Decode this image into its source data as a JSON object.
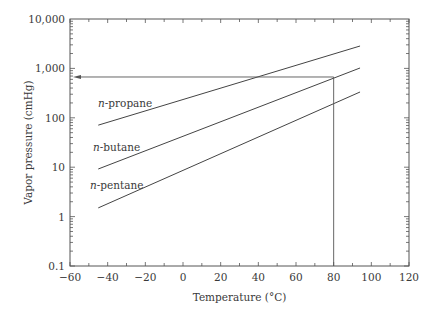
{
  "chart_data": {
    "type": "line",
    "title": "",
    "xlabel": "Temperature (°C)",
    "ylabel": "Vapor pressure (cmHg)",
    "xlim": [
      -60,
      120
    ],
    "ylim": [
      0.1,
      10000
    ],
    "yscale": "log",
    "grid": false,
    "legend": "inline labels",
    "x_ticks": [
      -60,
      -40,
      -20,
      0,
      20,
      40,
      60,
      80,
      100,
      120
    ],
    "x_tick_labels": [
      "−60",
      "−40",
      "−20",
      "0",
      "20",
      "40",
      "60",
      "80",
      "100",
      "120"
    ],
    "y_ticks": [
      0.1,
      1,
      10,
      100,
      1000,
      10000
    ],
    "y_tick_labels": [
      "0.1",
      "1",
      "10",
      "100",
      "1,000",
      "10,000"
    ],
    "series": [
      {
        "name": "n-propane",
        "prefix": "n",
        "suffix": "-propane",
        "x": [
          -45,
          94
        ],
        "values": [
          71,
          2840
        ],
        "label_pos": [
          98,
          107
        ]
      },
      {
        "name": "n-butane",
        "prefix": "n",
        "suffix": "-butane",
        "x": [
          -45,
          94
        ],
        "values": [
          9.2,
          1020
        ],
        "label_pos": [
          93,
          151
        ]
      },
      {
        "name": "n-pentane",
        "prefix": "n",
        "suffix": "-pentane",
        "x": [
          -45,
          94
        ],
        "values": [
          1.5,
          333
        ],
        "label_pos": [
          90,
          189
        ]
      }
    ],
    "annotations": [
      {
        "type": "vertical-line",
        "x": 80,
        "from_y": 0.1,
        "to_y": 670,
        "description": "reference at 80 °C up to n-butane line"
      },
      {
        "type": "horizontal-arrow",
        "y": 670,
        "from_x": 80,
        "to_x": -60,
        "description": "arrow pointing to y-axis at ~670 cmHg"
      }
    ]
  },
  "layout": {
    "plot": {
      "left": 70,
      "right": 409,
      "top": 19,
      "bottom": 266
    }
  }
}
